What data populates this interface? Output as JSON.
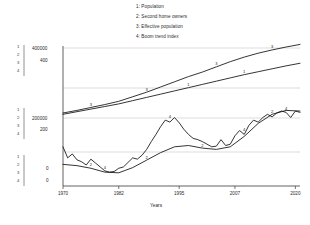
{
  "chart_data": {
    "type": "line",
    "title": "",
    "xlabel": "Years",
    "ylabel": "",
    "grid": true,
    "legend_position": "top",
    "xlim": [
      1970,
      2021
    ],
    "x_ticks": [
      "1970",
      "1982",
      "1995",
      "2007",
      "2020"
    ],
    "x_tick_values": [
      1970,
      1982,
      1995,
      2007,
      2020
    ],
    "axes": [
      {
        "name": "count-axis",
        "ticks": [
          "400000",
          "200000",
          "0"
        ],
        "tick_values": [
          400000,
          200000,
          0
        ],
        "ylim": [
          0,
          400000
        ],
        "series": [
          "Population",
          "Effective population"
        ]
      },
      {
        "name": "index-axis",
        "ticks": [
          "400",
          "200",
          "0"
        ],
        "tick_values": [
          400,
          200,
          0
        ],
        "ylim": [
          0,
          400
        ],
        "series": [
          "Second home owners",
          "Boom trend index"
        ]
      }
    ],
    "series_keys": [
      "1",
      "2",
      "3",
      "4"
    ],
    "legend": [
      {
        "key": "1",
        "label": "1: Population"
      },
      {
        "key": "2",
        "label": "2: Second home owners"
      },
      {
        "key": "3",
        "label": "3: Effective population"
      },
      {
        "key": "4",
        "label": "4: Boom trend index"
      }
    ],
    "series": [
      {
        "name": "Population",
        "key": "1",
        "axis": "count-axis",
        "x": [
          1970,
          1973,
          1976,
          1979,
          1982,
          1985,
          1988,
          1991,
          1994,
          1997,
          2000,
          2003,
          2006,
          2009,
          2012,
          2015,
          2018,
          2021
        ],
        "values": [
          196000,
          204000,
          212000,
          220000,
          228000,
          238000,
          248000,
          258000,
          268000,
          278000,
          288000,
          298000,
          308000,
          318000,
          327000,
          336000,
          345000,
          353000
        ],
        "inline_label_points": [
          [
            1997,
            278000
          ],
          [
            2009,
            318000
          ]
        ]
      },
      {
        "name": "Second home owners",
        "key": "2",
        "axis": "index-axis",
        "x": [
          1970,
          1973,
          1976,
          1979,
          1982,
          1985,
          1988,
          1991,
          1994,
          1997,
          2000,
          2003,
          2006,
          2009,
          2012,
          2015,
          2018,
          2021
        ],
        "values": [
          42,
          38,
          30,
          18,
          16,
          32,
          55,
          78,
          96,
          100,
          92,
          88,
          96,
          128,
          168,
          196,
          208,
          206
        ],
        "inline_label_points": [
          [
            1976,
            33
          ],
          [
            1988,
            55
          ],
          [
            2000,
            92
          ],
          [
            2015,
            196
          ]
        ]
      },
      {
        "name": "Effective population",
        "key": "3",
        "axis": "count-axis",
        "x": [
          1970,
          1973,
          1976,
          1979,
          1982,
          1985,
          1988,
          1991,
          1994,
          1997,
          2000,
          2003,
          2006,
          2009,
          2012,
          2015,
          2018,
          2021
        ],
        "values": [
          200000,
          208000,
          217000,
          226000,
          236000,
          250000,
          264000,
          280000,
          296000,
          312000,
          326000,
          342000,
          358000,
          372000,
          384000,
          394000,
          403000,
          411000
        ],
        "inline_label_points": [
          [
            1976,
            217000
          ],
          [
            1988,
            264000
          ],
          [
            2003,
            342000
          ],
          [
            2015,
            394000
          ]
        ]
      },
      {
        "name": "Boom trend index",
        "key": "4",
        "axis": "index-axis",
        "x": [
          1970,
          1971,
          1972,
          1973,
          1974,
          1975,
          1976,
          1977,
          1978,
          1979,
          1980,
          1981,
          1982,
          1983,
          1984,
          1985,
          1986,
          1987,
          1988,
          1989,
          1990,
          1991,
          1992,
          1993,
          1994,
          1995,
          1996,
          1997,
          1998,
          1999,
          2000,
          2001,
          2002,
          2003,
          2004,
          2005,
          2006,
          2007,
          2008,
          2009,
          2010,
          2011,
          2012,
          2013,
          2014,
          2015,
          2016,
          2017,
          2018,
          2019,
          2020,
          2021
        ],
        "values": [
          96,
          62,
          74,
          56,
          50,
          40,
          58,
          46,
          34,
          22,
          18,
          20,
          30,
          34,
          48,
          62,
          58,
          70,
          88,
          112,
          134,
          158,
          178,
          172,
          186,
          170,
          150,
          134,
          122,
          118,
          112,
          104,
          96,
          98,
          118,
          100,
          104,
          130,
          146,
          134,
          162,
          178,
          172,
          186,
          196,
          188,
          200,
          206,
          202,
          186,
          206,
          202
        ],
        "inline_label_points": [
          [
            1979,
            22
          ],
          [
            1993,
            180
          ],
          [
            2009,
            140
          ],
          [
            2018,
            204
          ]
        ]
      }
    ]
  },
  "axis_group_labels": {
    "top": [
      "1",
      "2",
      "3",
      "4"
    ],
    "middle": [
      "1",
      "2",
      "3",
      "4"
    ],
    "bottom": [
      "1",
      "2",
      "3",
      "4"
    ]
  }
}
